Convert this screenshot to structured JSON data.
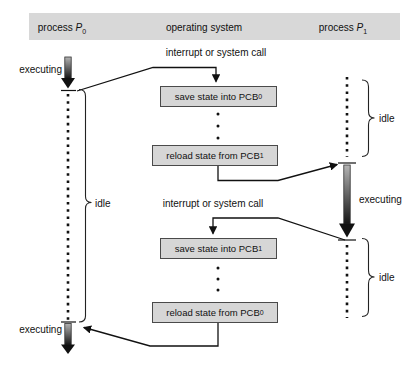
{
  "header": {
    "p0": {
      "word": "process ",
      "var": "P",
      "sub": "0"
    },
    "os": "operating system",
    "p1": {
      "word": "process ",
      "var": "P",
      "sub": "1"
    }
  },
  "os_flow": {
    "interrupt_top": "interrupt or system call",
    "interrupt_mid": "interrupt or system call",
    "boxes": [
      {
        "text": "save state into PCB",
        "sub": "0"
      },
      {
        "text": "reload state from PCB",
        "sub": "1"
      },
      {
        "text": "save state into PCB",
        "sub": "1"
      },
      {
        "text": "reload state from PCB",
        "sub": "0"
      }
    ]
  },
  "p0_timeline": {
    "executing_top": "executing",
    "idle": "idle",
    "executing_bottom": "executing"
  },
  "p1_timeline": {
    "idle_top": "idle",
    "executing": "executing",
    "idle_bottom": "idle"
  },
  "colors": {
    "header_bar": "#d8d8d8",
    "box_fill": "#d6d6d6",
    "box_border": "#4a4a4a",
    "line": "#111111",
    "arrow_gradient_top": "#b4b4b4",
    "arrow_gradient_bottom": "#141414"
  }
}
